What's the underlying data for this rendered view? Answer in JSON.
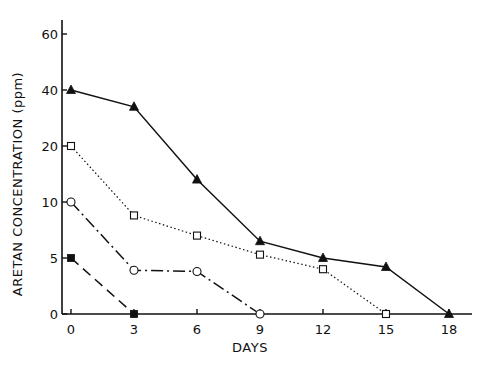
{
  "chart_data": {
    "type": "line",
    "title": "",
    "xlabel": "DAYS",
    "ylabel": "ARETAN CONCENTRATION (ppm)",
    "x_ticks": [
      0,
      3,
      6,
      9,
      12,
      15,
      18
    ],
    "y_ticks": [
      0,
      5,
      10,
      20,
      40,
      60
    ],
    "y_scale": "nonlinear (equally spaced ticks 0,5,10,20,40,60)",
    "xlim": [
      0,
      18
    ],
    "ylim": [
      0,
      60
    ],
    "grid": false,
    "legend": "none",
    "series": [
      {
        "name": "filled triangle (solid line)",
        "marker": "filled-triangle",
        "line": "solid",
        "x": [
          0,
          3,
          6,
          9,
          12,
          15,
          18
        ],
        "values": [
          40,
          34,
          14,
          6.5,
          5,
          4.2,
          0
        ]
      },
      {
        "name": "open square (dotted line)",
        "marker": "open-square",
        "line": "dotted",
        "x": [
          0,
          3,
          6,
          9,
          12,
          15
        ],
        "values": [
          20,
          8.8,
          7,
          5.3,
          4,
          0
        ]
      },
      {
        "name": "open circle (dash-dot line)",
        "marker": "open-circle",
        "line": "dash-dot",
        "x": [
          0,
          3,
          6,
          9
        ],
        "values": [
          10,
          3.9,
          3.8,
          0
        ]
      },
      {
        "name": "filled square (dashed line)",
        "marker": "filled-square",
        "line": "dashed",
        "x": [
          0,
          3
        ],
        "values": [
          5,
          0
        ]
      }
    ]
  }
}
